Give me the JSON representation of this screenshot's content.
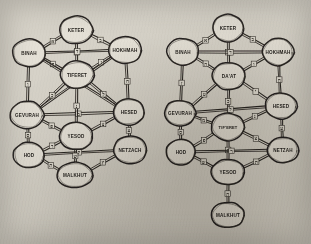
{
  "image": {
    "title": "Two hand-drawn Kabbalistic Tree of Life (Sefirot) diagrams",
    "medium": "pencil sketch on aged paper, photographed",
    "background_color": "#d6d2c8",
    "ink_color": "#2a2621",
    "node_fill_color": "#e4e0d6",
    "width": 311,
    "height": 244,
    "diagram_count": 2
  },
  "diagrams": [
    {
      "id": "left-tree",
      "name": "Tree of Life without Da'at",
      "node_count": 10,
      "edge_count": 22,
      "malkhut_attached": true,
      "nodes": [
        {
          "id": "keter",
          "label": "KETER",
          "cx": 76,
          "cy": 30,
          "rx": 17,
          "ry": 14
        },
        {
          "id": "binah",
          "label": "BINAH",
          "cx": 29,
          "cy": 53,
          "rx": 17,
          "ry": 14
        },
        {
          "id": "hokhmah",
          "label": "HOKHMAH",
          "cx": 125,
          "cy": 50,
          "rx": 17,
          "ry": 14
        },
        {
          "id": "tiferet",
          "label": "TIFERET",
          "cx": 77,
          "cy": 75,
          "rx": 17,
          "ry": 14
        },
        {
          "id": "gevurah",
          "label": "GEVURAH",
          "cx": 27,
          "cy": 115,
          "rx": 17,
          "ry": 14
        },
        {
          "id": "hesed",
          "label": "HESED",
          "cx": 129,
          "cy": 112,
          "rx": 16,
          "ry": 13
        },
        {
          "id": "yesod",
          "label": "YESOD",
          "cx": 76,
          "cy": 136,
          "rx": 17,
          "ry": 14
        },
        {
          "id": "hod",
          "label": "HOD",
          "cx": 29,
          "cy": 155,
          "rx": 16,
          "ry": 13
        },
        {
          "id": "netzach",
          "label": "NETZACH",
          "cx": 130,
          "cy": 150,
          "rx": 17,
          "ry": 14
        },
        {
          "id": "malkhut",
          "label": "MALKHUT",
          "cx": 75,
          "cy": 175,
          "rx": 18,
          "ry": 13
        }
      ],
      "edges": [
        {
          "from": "keter",
          "to": "binah",
          "label": "א"
        },
        {
          "from": "keter",
          "to": "hokhmah",
          "label": "ב"
        },
        {
          "from": "keter",
          "to": "tiferet",
          "label": "ג"
        },
        {
          "from": "binah",
          "to": "hokhmah",
          "label": "ד"
        },
        {
          "from": "binah",
          "to": "tiferet",
          "label": "ה"
        },
        {
          "from": "binah",
          "to": "gevurah",
          "label": "ו"
        },
        {
          "from": "hokhmah",
          "to": "tiferet",
          "label": "ז"
        },
        {
          "from": "hokhmah",
          "to": "hesed",
          "label": "ח"
        },
        {
          "from": "binah",
          "to": "hesed",
          "label": "ט"
        },
        {
          "from": "hokhmah",
          "to": "gevurah",
          "label": "י"
        },
        {
          "from": "tiferet",
          "to": "gevurah",
          "label": "כ"
        },
        {
          "from": "tiferet",
          "to": "hesed",
          "label": "ל"
        },
        {
          "from": "gevurah",
          "to": "hesed",
          "label": "מ"
        },
        {
          "from": "tiferet",
          "to": "yesod",
          "label": "נ"
        },
        {
          "from": "gevurah",
          "to": "hod",
          "label": "ס"
        },
        {
          "from": "hesed",
          "to": "netzach",
          "label": "ע"
        },
        {
          "from": "gevurah",
          "to": "yesod",
          "label": "פ"
        },
        {
          "from": "hesed",
          "to": "yesod",
          "label": "צ"
        },
        {
          "from": "hod",
          "to": "netzach",
          "label": "ק"
        },
        {
          "from": "yesod",
          "to": "hod",
          "label": "ר"
        },
        {
          "from": "yesod",
          "to": "malkhut",
          "label": "ש"
        },
        {
          "from": "hod",
          "to": "malkhut",
          "label": "ת"
        },
        {
          "from": "netzach",
          "to": "malkhut",
          "label": "ץ"
        }
      ]
    },
    {
      "id": "right-tree",
      "name": "Tree of Life with Da'at and detached Malkhut",
      "node_count": 10,
      "edge_count": 22,
      "malkhut_attached": false,
      "nodes": [
        {
          "id": "keter",
          "label": "KETER",
          "cx": 228,
          "cy": 28,
          "rx": 16,
          "ry": 14
        },
        {
          "id": "binah",
          "label": "BINAH",
          "cx": 183,
          "cy": 52,
          "rx": 16,
          "ry": 14
        },
        {
          "id": "hokhmah",
          "label": "HOKHMAH",
          "cx": 278,
          "cy": 52,
          "rx": 16,
          "ry": 14
        },
        {
          "id": "daat",
          "label": "DA'AT",
          "cx": 229,
          "cy": 76,
          "rx": 17,
          "ry": 14
        },
        {
          "id": "gevurah",
          "label": "GEVURAH",
          "cx": 180,
          "cy": 113,
          "rx": 16,
          "ry": 13
        },
        {
          "id": "hesed",
          "label": "HESED",
          "cx": 281,
          "cy": 106,
          "rx": 16,
          "ry": 13
        },
        {
          "id": "tiferet",
          "label": "TIF'ERET",
          "cx": 228,
          "cy": 127,
          "rx": 17,
          "ry": 14
        },
        {
          "id": "hod",
          "label": "HOD",
          "cx": 181,
          "cy": 152,
          "rx": 15,
          "ry": 13
        },
        {
          "id": "netzach",
          "label": "NETZAH",
          "cx": 283,
          "cy": 150,
          "rx": 16,
          "ry": 13
        },
        {
          "id": "yesod",
          "label": "YESOD",
          "cx": 228,
          "cy": 172,
          "rx": 17,
          "ry": 13
        },
        {
          "id": "malkhut",
          "label": "MALKHUT",
          "cx": 228,
          "cy": 215,
          "rx": 17,
          "ry": 13
        }
      ],
      "edges": [
        {
          "from": "keter",
          "to": "binah",
          "label": "א"
        },
        {
          "from": "keter",
          "to": "hokhmah",
          "label": "ב"
        },
        {
          "from": "keter",
          "to": "daat",
          "label": "ג"
        },
        {
          "from": "binah",
          "to": "hokhmah",
          "label": "ד"
        },
        {
          "from": "binah",
          "to": "daat",
          "label": "ה"
        },
        {
          "from": "hokhmah",
          "to": "daat",
          "label": "ו"
        },
        {
          "from": "binah",
          "to": "gevurah",
          "label": "ז"
        },
        {
          "from": "hokhmah",
          "to": "hesed",
          "label": "ח"
        },
        {
          "from": "daat",
          "to": "gevurah",
          "label": "ט"
        },
        {
          "from": "daat",
          "to": "hesed",
          "label": "י"
        },
        {
          "from": "daat",
          "to": "tiferet",
          "label": "כ"
        },
        {
          "from": "gevurah",
          "to": "hesed",
          "label": "ל"
        },
        {
          "from": "gevurah",
          "to": "tiferet",
          "label": "מ"
        },
        {
          "from": "hesed",
          "to": "tiferet",
          "label": "נ"
        },
        {
          "from": "gevurah",
          "to": "hod",
          "label": "ס"
        },
        {
          "from": "hesed",
          "to": "netzach",
          "label": "ע"
        },
        {
          "from": "tiferet",
          "to": "hod",
          "label": "פ"
        },
        {
          "from": "tiferet",
          "to": "netzach",
          "label": "צ"
        },
        {
          "from": "tiferet",
          "to": "yesod",
          "label": "ק"
        },
        {
          "from": "hod",
          "to": "netzach",
          "label": "ר"
        },
        {
          "from": "hod",
          "to": "yesod",
          "label": "ש"
        },
        {
          "from": "netzach",
          "to": "yesod",
          "label": "ת"
        },
        {
          "from": "yesod",
          "to": "malkhut",
          "label": "ה"
        }
      ]
    }
  ]
}
